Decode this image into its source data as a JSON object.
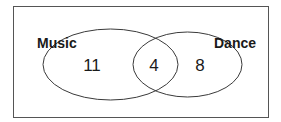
{
  "diagram": {
    "type": "venn",
    "sets": [
      {
        "name": "Music",
        "only_count": "11"
      },
      {
        "name": "Dance",
        "only_count": "8"
      }
    ],
    "intersection_count": "4",
    "colors": {
      "stroke": "#3a3a3a",
      "text": "#1a1a1a",
      "background": "#ffffff"
    }
  }
}
